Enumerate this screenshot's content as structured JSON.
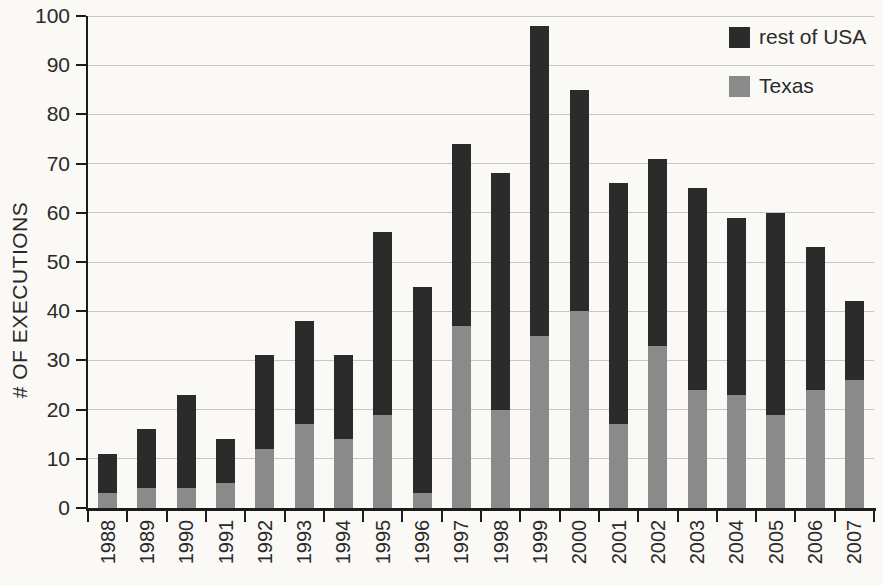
{
  "figure": {
    "background_color": "#fbf9f5",
    "axis_color": "#1c1c1c",
    "gridline_color": "#c7c6c2",
    "text_color": "#2a2a2a"
  },
  "y_axis_title": "# OF EXECUTIONS",
  "legend": {
    "items": [
      {
        "label": "rest of USA",
        "color": "#2b2b2b"
      },
      {
        "label": "Texas",
        "color": "#8a8a8a"
      }
    ]
  },
  "chart_data": {
    "type": "bar",
    "stacked": true,
    "title": "",
    "xlabel": "",
    "ylabel": "# OF EXECUTIONS",
    "categories": [
      "1988",
      "1989",
      "1990",
      "1991",
      "1992",
      "1993",
      "1994",
      "1995",
      "1996",
      "1997",
      "1998",
      "1999",
      "2000",
      "2001",
      "2002",
      "2003",
      "2004",
      "2005",
      "2006",
      "2007"
    ],
    "series": [
      {
        "name": "Texas",
        "color": "#8a8a8a",
        "values": [
          3,
          4,
          4,
          5,
          12,
          17,
          14,
          19,
          3,
          37,
          20,
          35,
          40,
          17,
          33,
          24,
          23,
          19,
          24,
          26
        ]
      },
      {
        "name": "rest of USA",
        "color": "#2b2b2b",
        "values": [
          8,
          12,
          19,
          9,
          19,
          21,
          17,
          37,
          42,
          37,
          48,
          63,
          45,
          49,
          38,
          41,
          36,
          41,
          29,
          16
        ]
      }
    ],
    "totals": [
      11,
      16,
      23,
      14,
      31,
      38,
      31,
      56,
      45,
      74,
      68,
      98,
      85,
      66,
      71,
      65,
      59,
      60,
      53,
      42
    ],
    "yticks": [
      0,
      10,
      20,
      30,
      40,
      50,
      60,
      70,
      80,
      90,
      100
    ],
    "ylim": [
      0,
      100
    ],
    "grid": true,
    "legend_position": "top-right"
  }
}
